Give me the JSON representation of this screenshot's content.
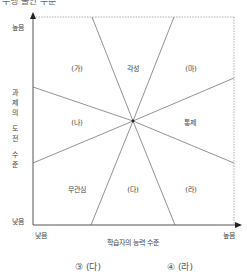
{
  "title": "수행 불안 수준",
  "diagram": {
    "y_axis": {
      "label_chars": [
        "과",
        "제",
        "의",
        "",
        "도",
        "전",
        "",
        "수",
        "준"
      ],
      "label": "과제의 도전 수준",
      "high": "높음",
      "low": "낮음"
    },
    "x_axis": {
      "label": "학습자의 능력 수준",
      "low": "낮음",
      "high": "높음"
    },
    "regions": {
      "top_left": "(가)",
      "top_center": "각성",
      "top_right": "(마)",
      "middle_left": "(나)",
      "middle_right": "통제",
      "bottom_left": "무관심",
      "bottom_center": "(다)",
      "bottom_right": "(라)"
    }
  },
  "options": [
    {
      "label": "③ (다)"
    },
    {
      "label": "④ (라)"
    }
  ],
  "colors": {
    "axis": "#555555",
    "lines": "#777777",
    "dashed": "#999999"
  }
}
